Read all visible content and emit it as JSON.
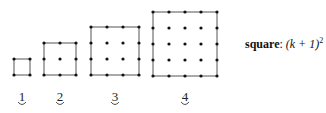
{
  "figures": [
    {
      "n": 1,
      "label": "1",
      "x": 14,
      "y": 59,
      "size": 16,
      "k": 1
    },
    {
      "n": 2,
      "label": "2",
      "x": 44,
      "y": 43,
      "size": 16,
      "k": 2
    },
    {
      "n": 3,
      "label": "3",
      "x": 91,
      "y": 27,
      "size": 16,
      "k": 3
    },
    {
      "n": 4,
      "label": "4",
      "x": 153,
      "y": 12,
      "size": 16,
      "k": 4
    }
  ],
  "label_y": 101,
  "formula": {
    "word": "square",
    "sep": ": ",
    "expr": "(k + 1)",
    "exp": "2"
  },
  "colors": {
    "line": "#555555",
    "dot": "#111111",
    "text": "#222222"
  }
}
